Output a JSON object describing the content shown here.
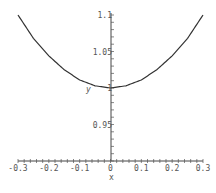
{
  "chart_data": {
    "type": "line",
    "title": "",
    "xlabel": "x",
    "ylabel": "y",
    "xlim": [
      -0.3,
      0.3
    ],
    "ylim": [
      0.9,
      1.1
    ],
    "xticks": [
      "-0.3",
      "-0.2",
      "-0.1",
      "0",
      "0.1",
      "0.2",
      "0.3"
    ],
    "yticks": [
      "0.95",
      "1",
      "1.05",
      "1.1"
    ],
    "grid": false,
    "legend": null,
    "series": [
      {
        "name": "y",
        "x": [
          -0.3,
          -0.25,
          -0.2,
          -0.15,
          -0.1,
          -0.05,
          0,
          0.05,
          0.1,
          0.15,
          0.2,
          0.25,
          0.3
        ],
        "values": [
          1.1,
          1.068,
          1.044,
          1.025,
          1.011,
          1.003,
          1.0,
          1.003,
          1.011,
          1.025,
          1.044,
          1.068,
          1.1
        ]
      }
    ]
  }
}
